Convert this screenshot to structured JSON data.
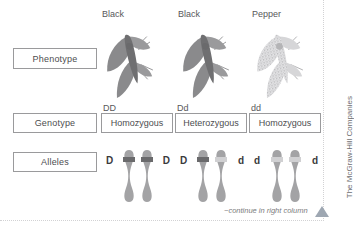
{
  "figure": {
    "colors": {
      "moth_dark": "#8a8a8c",
      "moth_light": "#c9c9cb",
      "chromosome": "#a3a3a5",
      "band_dominant": "#6a6a6c",
      "band_recessive": "#d0d0d2",
      "box_border": "#9a9a9c",
      "text": "#58585a",
      "triangle": "#9ea7b2"
    }
  },
  "row_labels": [
    {
      "label": "Phenotype"
    },
    {
      "label": "Genotype"
    },
    {
      "label": "Alleles"
    }
  ],
  "columns": [
    {
      "phenotype_name": "Black",
      "moth_type": "dark-moth",
      "genotype_code": "DD",
      "genotype_name": "Homozygous",
      "allele_left": "D",
      "allele_right": "D",
      "band_left": "dominant",
      "band_right": "dominant"
    },
    {
      "phenotype_name": "Black",
      "moth_type": "dark-moth",
      "genotype_code": "Dd",
      "genotype_name": "Heterozygous",
      "allele_left": "D",
      "allele_right": "d",
      "band_left": "dominant",
      "band_right": "recessive"
    },
    {
      "phenotype_name": "Pepper",
      "moth_type": "peppered-moth",
      "genotype_code": "dd",
      "genotype_name": "Homozygous",
      "allele_left": "d",
      "allele_right": "d",
      "band_left": "recessive",
      "band_right": "recessive"
    }
  ],
  "footer": {
    "note": "~continue in right column",
    "marker_icon": "triangle-marker"
  },
  "credit": {
    "text": "The McGraw-Hill Companies"
  }
}
